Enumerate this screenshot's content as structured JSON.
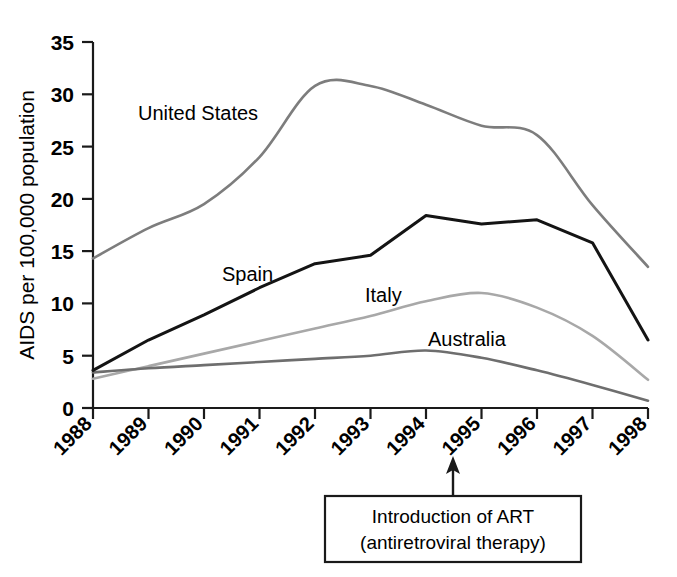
{
  "chart_data": {
    "type": "line",
    "title": "",
    "xlabel": "",
    "ylabel": "AIDS per 100,000 population",
    "categories": [
      "1988",
      "1989",
      "1990",
      "1991",
      "1992",
      "1993",
      "1994",
      "1995",
      "1996",
      "1997",
      "1998"
    ],
    "x": [
      1988,
      1989,
      1990,
      1991,
      1992,
      1993,
      1994,
      1995,
      1996,
      1997,
      1998
    ],
    "xlim": [
      1988,
      1998
    ],
    "ylim": [
      0,
      35
    ],
    "yticks": [
      0,
      5,
      10,
      15,
      20,
      25,
      30,
      35
    ],
    "ytick_labels": [
      "0",
      "5",
      "10",
      "15",
      "20",
      "25",
      "30",
      "35"
    ],
    "grid": false,
    "legend": "inline-labels",
    "series": [
      {
        "name": "United States",
        "color": "#7d7d7d",
        "width": 2.6,
        "values": [
          14.3,
          17.2,
          19.5,
          24.0,
          30.8,
          30.8,
          29.0,
          27.0,
          26.1,
          19.4,
          13.5
        ]
      },
      {
        "name": "Spain",
        "color": "#141414",
        "width": 3.0,
        "values": [
          3.6,
          6.5,
          8.9,
          11.5,
          13.8,
          14.6,
          18.4,
          17.6,
          18.0,
          15.8,
          6.5
        ]
      },
      {
        "name": "Italy",
        "color": "#a8a8a8",
        "width": 2.6,
        "values": [
          2.8,
          4.0,
          5.2,
          6.4,
          7.6,
          8.8,
          10.2,
          11.0,
          9.6,
          6.9,
          2.7
        ]
      },
      {
        "name": "Australia",
        "color": "#6e6e6e",
        "width": 2.6,
        "values": [
          3.4,
          3.8,
          4.1,
          4.4,
          4.7,
          5.0,
          5.5,
          4.8,
          3.6,
          2.2,
          0.7
        ]
      }
    ],
    "annotations": [
      {
        "id": "art-annotation",
        "line1": "Introduction of ART",
        "line2": "(antiretroviral therapy)",
        "arrow_x": 1994.5,
        "arrow_points_to": "x-axis"
      }
    ],
    "series_label_positions": [
      {
        "name": "United States",
        "x": 138,
        "y": 120
      },
      {
        "name": "Spain",
        "x": 222,
        "y": 281
      },
      {
        "name": "Italy",
        "x": 365,
        "y": 302
      },
      {
        "name": "Australia",
        "x": 428,
        "y": 346
      }
    ]
  }
}
